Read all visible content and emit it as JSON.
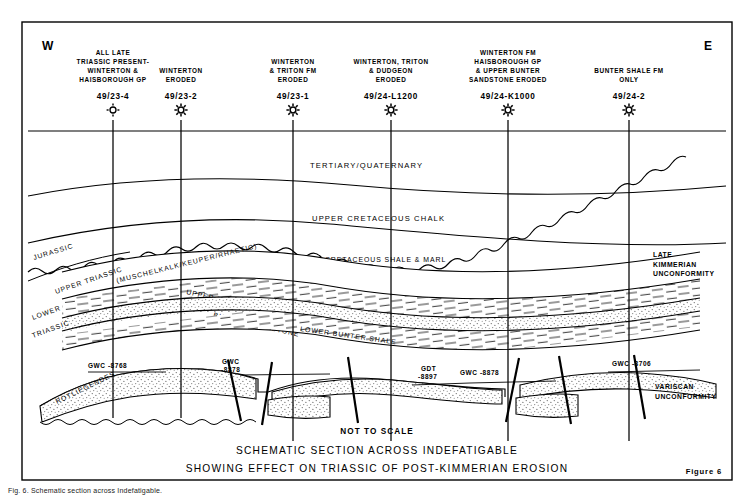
{
  "figure": {
    "compass_west": "W",
    "compass_east": "E",
    "figure_number": "Figure 6",
    "not_to_scale": "NOT TO SCALE",
    "title_line1": "SCHEMATIC SECTION ACROSS INDEFATIGABLE",
    "title_line2": "SHOWING EFFECT ON TRIASSIC OF POST-KIMMERIAN EROSION",
    "caption": "Fig. 6. Schematic section across Indefatigable."
  },
  "wells": [
    {
      "name": "49/23-4",
      "header_lines": [
        "ALL LATE",
        "TRIASSIC PRESENT-",
        "WINTERTON &",
        "HAISBOROUGH GP"
      ],
      "x": 113,
      "symbol": "well-symbol-open"
    },
    {
      "name": "49/23-2",
      "header_lines": [
        "WINTERTON",
        "ERODED"
      ],
      "x": 181,
      "symbol": "well-symbol-star"
    },
    {
      "name": "49/23-1",
      "header_lines": [
        "WINTERTON",
        "& TRITON FM",
        "ERODED"
      ],
      "x": 293,
      "symbol": "well-symbol-star"
    },
    {
      "name": "49/24-L1200",
      "header_lines": [
        "WINTERTON, TRITON",
        "& DUDGEON",
        "ERODED"
      ],
      "x": 391,
      "symbol": "well-symbol-star"
    },
    {
      "name": "49/24-K1000",
      "header_lines": [
        "WINTERTON FM",
        "HAISBOROUGH GP",
        "& UPPER BUNTER",
        "SANDSTONE ERODED"
      ],
      "x": 508,
      "symbol": "well-symbol-star"
    },
    {
      "name": "49/24-2",
      "header_lines": [
        "BUNTER SHALE FM",
        "ONLY"
      ],
      "x": 629,
      "symbol": "well-symbol-star"
    }
  ],
  "strat_labels": {
    "tertiary": "TERTIARY/QUATERNARY",
    "upper_chalk": "UPPER CRETACEOUS CHALK",
    "lower_cret": "LOWER   CRETACEOUS   SHALE  &  MARL",
    "jurassic": "JURASSIC",
    "upper_triassic": "UPPER  TRIASSIC",
    "muschelkalk": "(MUSCHELKALK/KEUPER/RHAETIC)",
    "lower": "LOWER",
    "triassic": "TRIASSIC",
    "upper_bunter_shale": "UPPER    BUNTER    SHALE",
    "bunter_sandstone": "BUNTER   SANDSTONE",
    "lower_bunter_shale": "LOWER   BUNTER   SHALE",
    "rotliegendes": "ROTLIEGENDES"
  },
  "unconformities": {
    "late_kimmerian": [
      "LATE",
      "KIMMERIAN",
      "UNCONFORMITY"
    ],
    "variscan": [
      "VARISCAN",
      "UNCONFORMITY"
    ]
  },
  "contacts": [
    {
      "label": "GWC -8768",
      "x": 88,
      "y": 368
    },
    {
      "label": "GWC",
      "x": 222,
      "y": 364
    },
    {
      "label": "-8878",
      "x": 221,
      "y": 372
    },
    {
      "label": "GDT",
      "x": 421,
      "y": 371
    },
    {
      "label": "-8897",
      "x": 418,
      "y": 379
    },
    {
      "label": "GWC -8878",
      "x": 460,
      "y": 375
    },
    {
      "label": "GWC -8706",
      "x": 612,
      "y": 366
    }
  ],
  "colors": {
    "ink": "#000000",
    "paper": "#ffffff",
    "stipple": "#8a8a8a"
  }
}
